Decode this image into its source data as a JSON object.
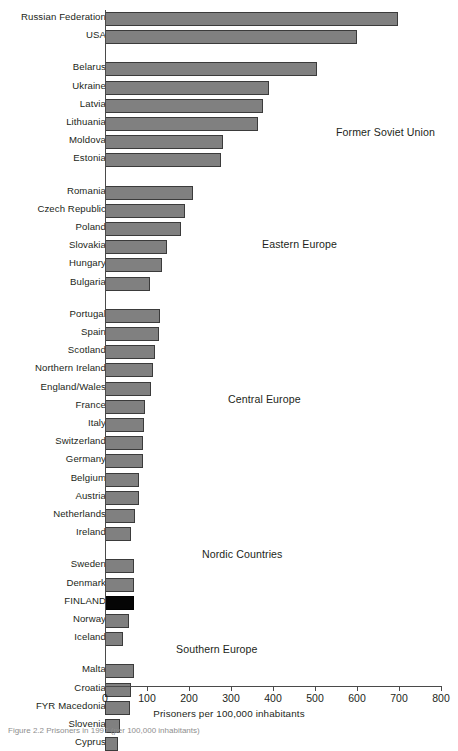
{
  "chart_data": {
    "type": "bar",
    "orientation": "horizontal",
    "title": "",
    "xlabel": "Prisoners per 100,000 inhabitants",
    "ylabel": "",
    "xlim": [
      0,
      800
    ],
    "xticks": [
      0,
      100,
      200,
      300,
      400,
      500,
      600,
      700,
      800
    ],
    "grid": false,
    "legend": "none",
    "highlight_category": "FINLAND",
    "colors": {
      "bar_fill": "#808080",
      "bar_stroke": "#3b3b3b",
      "highlight_fill": "#050505",
      "axis": "#4a4a4a",
      "text": "#231f20"
    },
    "groups": [
      {
        "name": "Former Soviet Union",
        "label_x": 336,
        "label_y": 126,
        "categories": [
          "Russian Federation",
          "USA",
          "Belarus",
          "Ukraine",
          "Latvia",
          "Lithuania",
          "Moldova",
          "Estonia"
        ],
        "values": [
          698,
          600,
          505,
          390,
          375,
          365,
          280,
          275
        ],
        "gaps_after": [
          1
        ]
      },
      {
        "name": "Eastern Europe",
        "label_x": 262,
        "label_y": 238,
        "categories": [
          "Romania",
          "Czech Republic",
          "Poland",
          "Slovakia",
          "Hungary",
          "Bulgaria"
        ],
        "values": [
          210,
          190,
          180,
          148,
          135,
          108
        ],
        "gaps_after": []
      },
      {
        "name": "Central Europe",
        "label_x": 228,
        "label_y": 393,
        "categories": [
          "Portugal",
          "Spain",
          "Scotland",
          "Northern Ireland",
          "England/Wales",
          "France",
          "Italy",
          "Switzerland",
          "Germany",
          "Belgium",
          "Austria",
          "Netherlands",
          "Ireland"
        ],
        "values": [
          130,
          128,
          118,
          115,
          110,
          95,
          92,
          90,
          90,
          82,
          80,
          72,
          62
        ],
        "gaps_after": []
      },
      {
        "name": "Nordic Countries",
        "label_x": 202,
        "label_y": 548,
        "categories": [
          "Sweden",
          "Denmark",
          "FINLAND",
          "Norway",
          "Iceland"
        ],
        "values": [
          68,
          68,
          68,
          58,
          42
        ],
        "gaps_after": []
      },
      {
        "name": "Southern Europe",
        "label_x": 176,
        "label_y": 643,
        "categories": [
          "Malta",
          "Croatia",
          "FYR Macedonia",
          "Slovenia",
          "Cyprus"
        ],
        "values": [
          68,
          62,
          60,
          35,
          30
        ],
        "gaps_after": []
      }
    ]
  },
  "caption": {
    "text": "Figure 2.2 Prisoners in 1997 (per 100,000 inhabitants)"
  }
}
